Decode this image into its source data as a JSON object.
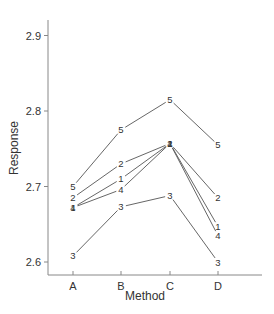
{
  "chart_data": {
    "type": "line",
    "title": "",
    "xlabel": "Method",
    "ylabel": "Response",
    "categories": [
      "A",
      "B",
      "C",
      "D"
    ],
    "ylim": [
      2.58,
      2.92
    ],
    "yticks": [
      2.6,
      2.7,
      2.8,
      2.9
    ],
    "ytick_labels": [
      "2.6",
      "2.7",
      "2.8",
      "2.9"
    ],
    "grid": false,
    "legend": "none (series identified by numeric point labels)",
    "series": [
      {
        "name": "5",
        "values": [
          2.7,
          2.775,
          2.815,
          2.755
        ]
      },
      {
        "name": "2",
        "values": [
          2.685,
          2.73,
          2.757,
          2.685
        ]
      },
      {
        "name": "1",
        "values": [
          2.672,
          2.71,
          2.757,
          2.647
        ]
      },
      {
        "name": "4",
        "values": [
          2.672,
          2.696,
          2.757,
          2.635
        ]
      },
      {
        "name": "3",
        "values": [
          2.608,
          2.673,
          2.688,
          2.6
        ]
      }
    ]
  },
  "colors": {
    "line": "#555555",
    "axis": "#888888",
    "text": "#333333"
  }
}
